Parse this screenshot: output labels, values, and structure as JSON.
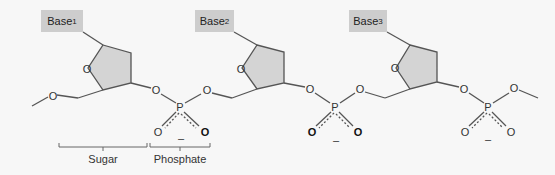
{
  "diagram": {
    "title": "",
    "nucleotides": [
      {
        "base_label": "Base",
        "base_sub": "1"
      },
      {
        "base_label": "Base",
        "base_sub": "2"
      },
      {
        "base_label": "Base",
        "base_sub": "3"
      }
    ],
    "atoms": {
      "oxygen": "O",
      "phosphorus": "P",
      "minus": "–"
    },
    "brackets": {
      "sugar": "Sugar",
      "phosphate": "Phosphate"
    },
    "colors": {
      "background": "#f7f7f7",
      "base_box": "#cdcdcd",
      "ring_fill": "#d4d4d4",
      "line": "#555555"
    }
  }
}
